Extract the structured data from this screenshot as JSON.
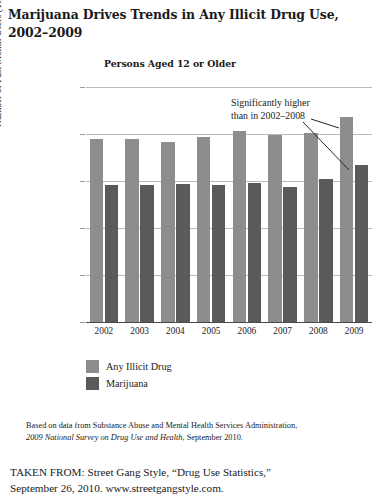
{
  "figure": {
    "title": "Marijuana Drives Trends in Any Illicit Drug Use, 2002–2009",
    "subtitle": "Persons Aged 12 or Older",
    "annotation": "Significantly higher\nthan in 2002–2008"
  },
  "source_note": {
    "line1_pre": "Based on data from Substance Abuse and Mental Health Services Administration,",
    "line2_italic": "2009 National Survey on Drug Use and Health",
    "line2_post": ", September 2010."
  },
  "attribution": {
    "line1": "TAKEN FROM: Street Gang Style, “Drug Use Statistics,”",
    "line2": "September 26, 2010. www.streetgangstyle.com."
  },
  "colors": {
    "illicit": "#8d8d8d",
    "marijuana": "#5a5a5a",
    "gridline": "#b9b9b9",
    "axis": "#4a4a4a",
    "text": "#1a1a1a"
  },
  "chart_data": {
    "type": "bar",
    "title": "Marijuana Drives Trends in Any Illicit Drug Use, 2002–2009",
    "subtitle": "Persons Aged 12 or Older",
    "xlabel": "",
    "ylabel": "Number of Past Month Users (Thousands)",
    "categories": [
      "2002",
      "2003",
      "2004",
      "2005",
      "2006",
      "2007",
      "2008",
      "2009"
    ],
    "series": [
      {
        "name": "Any Illicit Drug",
        "color": "#8d8d8d",
        "values": [
          19500,
          19500,
          19100,
          19700,
          20300,
          19900,
          20100,
          21800
        ]
      },
      {
        "name": "Marijuana",
        "color": "#5a5a5a",
        "values": [
          14600,
          14600,
          14700,
          14600,
          14800,
          14400,
          15200,
          16700
        ]
      }
    ],
    "ylim": [
      0,
      25000
    ],
    "yticks": [
      0,
      5000,
      10000,
      15000,
      20000,
      25000
    ],
    "ytick_labels": [
      "0",
      "5,000",
      "10,000",
      "15,000",
      "20,000",
      "25,000"
    ],
    "grid": true,
    "legend_position": "below-left",
    "annotations": [
      {
        "text": "Significantly higher than in 2002–2008",
        "points_to": [
          "2009 Any Illicit Drug",
          "2009 Marijuana"
        ]
      }
    ]
  }
}
